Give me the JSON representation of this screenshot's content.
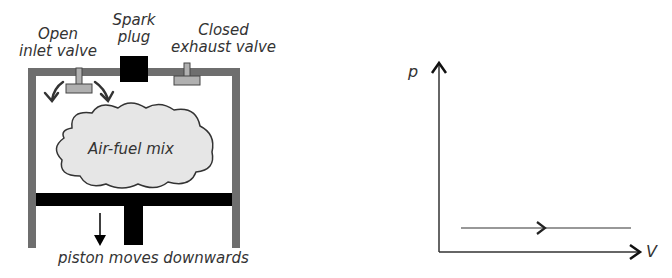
{
  "engine": {
    "labels": {
      "inlet": [
        "Open",
        "inlet valve"
      ],
      "spark": [
        "Spark",
        "plug"
      ],
      "exhaust": [
        "Closed",
        "exhaust valve"
      ],
      "cloud": "Air-fuel mix",
      "piston": "piston moves downwards"
    },
    "colors": {
      "wall": "#6e6e6e",
      "valve_fill": "#b0b0b0",
      "cloud_fill": "#e6e6e6",
      "piston": "#000000",
      "text": "#333333"
    }
  },
  "pv_diagram": {
    "y_axis_label": "p",
    "x_axis_label": "V",
    "process": "constant pressure, volume increasing (intake stroke)",
    "arrow_direction": "right"
  }
}
